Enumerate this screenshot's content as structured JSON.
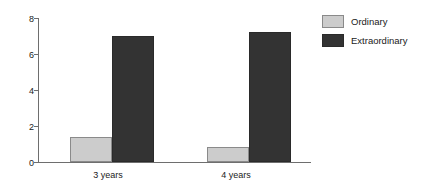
{
  "chart_data": {
    "type": "bar",
    "title": "",
    "xlabel": "",
    "ylabel": "",
    "categories": [
      "3 years",
      "4 years"
    ],
    "series": [
      {
        "name": "Ordinary",
        "values": [
          1.4,
          0.85
        ],
        "color": "#cccccc"
      },
      {
        "name": "Extraordinary",
        "values": [
          7.0,
          7.25
        ],
        "color": "#333333"
      }
    ],
    "ylim": [
      0,
      8
    ],
    "yticks": [
      0,
      2,
      4,
      6,
      8
    ],
    "ytick_labels": [
      "0",
      "2",
      "4",
      "6",
      "8"
    ],
    "grid": false,
    "legend_position": "right"
  },
  "axis": {
    "ticks": [
      {
        "label": "8",
        "value": 8
      },
      {
        "label": "6",
        "value": 6
      },
      {
        "label": "4",
        "value": 4
      },
      {
        "label": "2",
        "value": 2
      },
      {
        "label": "0",
        "value": 0
      }
    ]
  },
  "legend": {
    "items": [
      {
        "label": "Ordinary",
        "swatch": "ordinary"
      },
      {
        "label": "Extraordinary",
        "swatch": "extraordinary"
      }
    ]
  },
  "categories": [
    {
      "label": "3 years"
    },
    {
      "label": "4 years"
    }
  ]
}
